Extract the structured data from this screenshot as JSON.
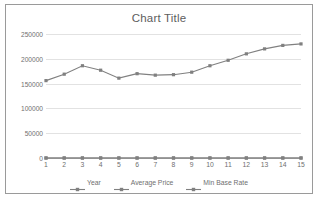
{
  "chart_data": {
    "type": "line",
    "title": "Chart Title",
    "xlabel": "",
    "ylabel": "",
    "grid": true,
    "legend_position": "bottom",
    "categories": [
      "1",
      "2",
      "3",
      "4",
      "5",
      "6",
      "7",
      "8",
      "9",
      "10",
      "11",
      "12",
      "13",
      "14",
      "15"
    ],
    "ylim": [
      0,
      250000
    ],
    "yticks": [
      0,
      50000,
      100000,
      150000,
      200000,
      250000
    ],
    "ytick_labels": [
      "0",
      "50000",
      "100000",
      "150000",
      "200000",
      "250000"
    ],
    "series": [
      {
        "name": "Year",
        "color": "#808080",
        "values": [
          1,
          2,
          3,
          4,
          5,
          6,
          7,
          8,
          9,
          10,
          11,
          12,
          13,
          14,
          15
        ]
      },
      {
        "name": "Average Price",
        "color": "#808080",
        "values": [
          156000,
          169000,
          186000,
          177000,
          161000,
          170000,
          167000,
          168000,
          173000,
          186000,
          197000,
          210000,
          220000,
          227000,
          230000
        ]
      },
      {
        "name": "Min Base Rate",
        "color": "#808080",
        "values": [
          0,
          0,
          0,
          0,
          0,
          0,
          0,
          0,
          0,
          0,
          0,
          0,
          0,
          0,
          0
        ]
      }
    ]
  },
  "colors": {
    "frame_border": "#9a9a9a",
    "gridline": "#e2e2e2",
    "axis": "#c4c4c4",
    "text": "#6f6f6f",
    "title_text": "#5d5d5d",
    "plot_background": "#ffffff"
  }
}
